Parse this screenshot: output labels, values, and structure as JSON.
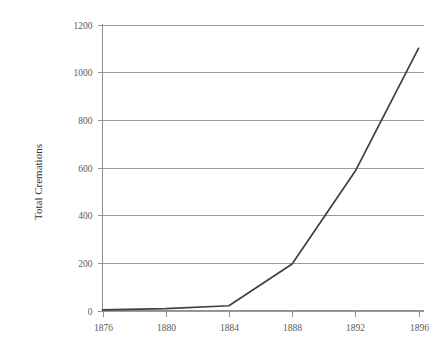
{
  "chart_data": {
    "type": "line",
    "title": "",
    "subtitle": "",
    "xlabel": "",
    "ylabel": "Total Cremations",
    "x": [
      1876,
      1880,
      1884,
      1888,
      1892,
      1896
    ],
    "values": [
      3,
      8,
      20,
      195,
      585,
      1100
    ],
    "series": [
      {
        "name": "Total Cremations",
        "values": [
          3,
          8,
          20,
          195,
          585,
          1100
        ],
        "color": "#404040"
      }
    ],
    "xtick_labels": [
      "1876",
      "1880",
      "1884",
      "1888",
      "1892",
      "1896"
    ],
    "ytick_labels": [
      "0",
      "200",
      "400",
      "600",
      "800",
      "1000",
      "1200"
    ],
    "ytick_values": [
      0,
      200,
      400,
      600,
      800,
      1000,
      1200
    ],
    "xlim": [
      1876,
      1896
    ],
    "ylim": [
      0,
      1200
    ],
    "grid": "horizontal",
    "legend": "none",
    "annotations": []
  },
  "colors": {
    "background": "#ffffff",
    "line": "#404040",
    "gridline": "#9a9a9a",
    "axis": "#8f8f8f",
    "tick_text": "#5a5a5a",
    "title_text": "#333333"
  }
}
